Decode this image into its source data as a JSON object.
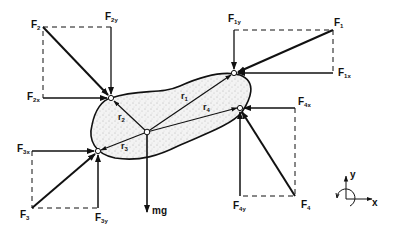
{
  "diagram": {
    "colors": {
      "stroke": "#111111",
      "body_fill": "#e9e9e9",
      "background": "#ffffff"
    },
    "forces": [
      {
        "id": "F1",
        "label": "F",
        "sub": "1",
        "x_label": "F",
        "x_sub": "1x",
        "y_label": "F",
        "y_sub": "1y"
      },
      {
        "id": "F2",
        "label": "F",
        "sub": "2",
        "x_label": "F",
        "x_sub": "2x",
        "y_label": "F",
        "y_sub": "2y"
      },
      {
        "id": "F3",
        "label": "F",
        "sub": "3",
        "x_label": "F",
        "x_sub": "3x",
        "y_label": "F",
        "y_sub": "3y"
      },
      {
        "id": "F4",
        "label": "F",
        "sub": "4",
        "x_label": "F",
        "x_sub": "4x",
        "y_label": "F",
        "y_sub": "4y"
      }
    ],
    "position_vectors": [
      {
        "label": "r",
        "sub": "1"
      },
      {
        "label": "r",
        "sub": "2"
      },
      {
        "label": "r",
        "sub": "3"
      },
      {
        "label": "r",
        "sub": "4"
      }
    ],
    "weight": {
      "label": "mg"
    },
    "axes": {
      "x": "x",
      "y": "y"
    }
  }
}
